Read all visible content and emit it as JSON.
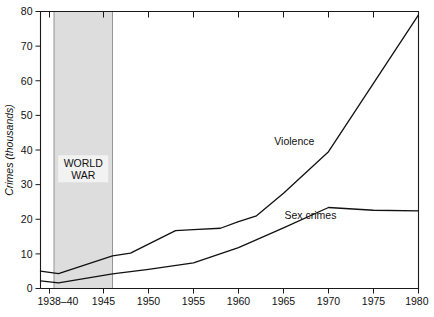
{
  "chart_data": {
    "type": "line",
    "title": "",
    "xlabel": "",
    "ylabel": "Crimes (thousands)",
    "xlim": [
      1938,
      1980
    ],
    "ylim": [
      0,
      80
    ],
    "grid": false,
    "legend_position": "inline-labels",
    "x_tick_labels": [
      "1938–40",
      "1945",
      "1950",
      "1955",
      "1960",
      "1965",
      "1970",
      "1975",
      "1980"
    ],
    "x_tick_values": [
      1939,
      1945,
      1950,
      1955,
      1960,
      1965,
      1970,
      1975,
      1980
    ],
    "y_tick_labels": [
      "0",
      "10",
      "20",
      "30",
      "40",
      "50",
      "60",
      "70",
      "80"
    ],
    "y_tick_values": [
      0,
      10,
      20,
      30,
      40,
      50,
      60,
      70,
      80
    ],
    "series": [
      {
        "name": "Violence",
        "label": "Violence",
        "label_x": 1966.2,
        "label_y": 41.5,
        "x": [
          1938,
          1940,
          1946,
          1948,
          1953,
          1955,
          1958,
          1960,
          1962,
          1965,
          1970,
          1980
        ],
        "y": [
          5.0,
          4.3,
          9.4,
          10.2,
          16.7,
          17.0,
          17.4,
          19.3,
          21.0,
          27.5,
          39.5,
          79.0
        ]
      },
      {
        "name": "Sex crimes",
        "label": "Sex crimes",
        "label_x": 1968.0,
        "label_y": 20.0,
        "x": [
          1938,
          1940,
          1946,
          1950,
          1955,
          1960,
          1965,
          1970,
          1975,
          1980
        ],
        "y": [
          2.2,
          1.6,
          4.2,
          5.5,
          7.4,
          11.8,
          17.5,
          23.4,
          22.6,
          22.4
        ]
      }
    ],
    "annotations": [
      {
        "type": "band",
        "name": "world-war",
        "label_lines": [
          "WORLD",
          "WAR"
        ],
        "x_start": 1939.5,
        "x_end": 1946.0,
        "label_x": 1942.75,
        "label_y": 35.0,
        "color": "#dddddd"
      }
    ]
  }
}
